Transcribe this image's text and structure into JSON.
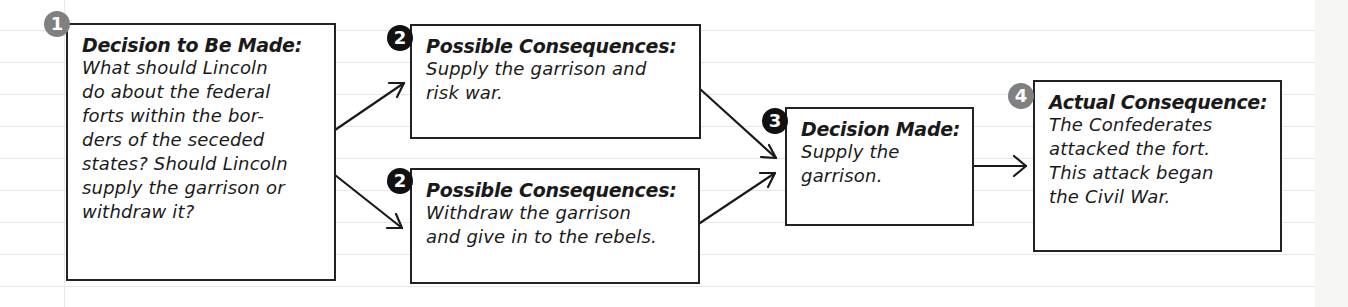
{
  "diagram": {
    "colors": {
      "box_border": "#222222",
      "text": "#1a1a1a",
      "badge_gray": "#808080",
      "badge_black": "#111111",
      "ruled_line": "#e6e6e6"
    },
    "steps": [
      {
        "badge": "1",
        "badge_style": "gray",
        "title": "Decision to Be Made:",
        "body": "What should Lincoln\ndo about the federal\nforts within the bor-\nders of the seceded\nstates? Should Lincoln\nsupply the garrison or\nwithdraw it?"
      },
      {
        "badge": "2",
        "badge_style": "black",
        "title": "Possible Consequences:",
        "body": "Supply the garrison and\nrisk war."
      },
      {
        "badge": "2",
        "badge_style": "black",
        "title": "Possible Consequences:",
        "body": "Withdraw the garrison\nand give in to the rebels."
      },
      {
        "badge": "3",
        "badge_style": "black",
        "title": "Decision Made:",
        "body": "Supply the\ngarrison."
      },
      {
        "badge": "4",
        "badge_style": "gray",
        "title": "Actual Consequence:",
        "body": "The Confederates\nattacked the fort.\nThis attack began\nthe Civil War."
      }
    ],
    "connections": [
      {
        "from": "step-1",
        "to": "step-2a"
      },
      {
        "from": "step-1",
        "to": "step-2b"
      },
      {
        "from": "step-2a",
        "to": "step-3"
      },
      {
        "from": "step-2b",
        "to": "step-3"
      },
      {
        "from": "step-3",
        "to": "step-4"
      }
    ]
  }
}
